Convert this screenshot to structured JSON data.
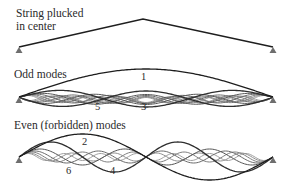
{
  "colors": {
    "background": "#ffffff",
    "text": "#2a2a2a",
    "string_dark": "#1e1e1e",
    "anchor": "#6e6e6e",
    "mode_grays": [
      "#1e1e1e",
      "#2e2e2e",
      "#555555",
      "#6a6a6a",
      "#7e7e7e",
      "#909090",
      "#a0a0a0"
    ]
  },
  "panels": [
    {
      "id": "plucked",
      "caption_lines": [
        "String plucked",
        "in center"
      ],
      "caption_x": 16,
      "caption_y": [
        17,
        30
      ],
      "left": [
        19,
        47
      ],
      "right": [
        273,
        47
      ],
      "shape": "triangle",
      "peak": [
        143,
        19
      ]
    },
    {
      "id": "odd",
      "caption_lines": [
        "Odd modes"
      ],
      "caption_x": 14,
      "caption_y": [
        78
      ],
      "left": [
        19,
        97
      ],
      "right": [
        273,
        97
      ],
      "shape": "modes",
      "modes": [
        {
          "n": 1,
          "amp": 28,
          "offset": 0
        },
        {
          "n": 3,
          "amp": 8,
          "offset": 2
        },
        {
          "n": 5,
          "amp": 5,
          "offset": 2.5
        },
        {
          "n": 7,
          "amp": 4,
          "offset": 2.5
        },
        {
          "n": 9,
          "amp": 3.5,
          "offset": 3
        },
        {
          "n": 11,
          "amp": 3,
          "offset": 3
        },
        {
          "n": 13,
          "amp": 2.5,
          "offset": 3
        }
      ],
      "labels": [
        {
          "text": "1",
          "x": 141,
          "y": 80
        },
        {
          "text": "5",
          "x": 95,
          "y": 110
        },
        {
          "text": "3",
          "x": 141,
          "y": 110
        }
      ]
    },
    {
      "id": "even",
      "caption_lines": [
        "Even (forbidden) modes"
      ],
      "caption_x": 14,
      "caption_y": [
        129
      ],
      "left": [
        19,
        157
      ],
      "right": [
        273,
        157
      ],
      "shape": "modes",
      "modes": [
        {
          "n": 2,
          "amp": 23,
          "offset": 0
        },
        {
          "n": 4,
          "amp": 15,
          "offset": 0
        },
        {
          "n": 6,
          "amp": 8,
          "offset": 0
        },
        {
          "n": 8,
          "amp": 6,
          "offset": 0
        },
        {
          "n": 10,
          "amp": 5,
          "offset": 0
        },
        {
          "n": 12,
          "amp": 4,
          "offset": 0
        },
        {
          "n": 14,
          "amp": 3.5,
          "offset": 0
        }
      ],
      "labels": [
        {
          "text": "2",
          "x": 82,
          "y": 145
        },
        {
          "text": "6",
          "x": 66,
          "y": 174
        },
        {
          "text": "4",
          "x": 110,
          "y": 174
        }
      ]
    }
  ]
}
